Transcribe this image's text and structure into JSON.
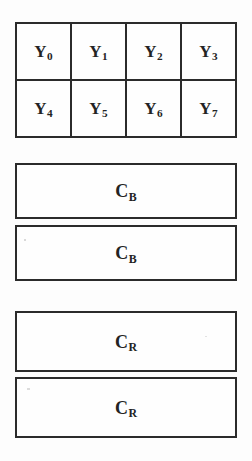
{
  "diagram": {
    "background_color": "#fdfdfd",
    "line_color": "#2b2b2b",
    "text_color": "#232323"
  },
  "luma_grid": {
    "name": "Y",
    "rows": 2,
    "cols": 4,
    "cells": [
      {
        "base": "Y",
        "sub": "0"
      },
      {
        "base": "Y",
        "sub": "1"
      },
      {
        "base": "Y",
        "sub": "2"
      },
      {
        "base": "Y",
        "sub": "3"
      },
      {
        "base": "Y",
        "sub": "4"
      },
      {
        "base": "Y",
        "sub": "5"
      },
      {
        "base": "Y",
        "sub": "6"
      },
      {
        "base": "Y",
        "sub": "7"
      }
    ]
  },
  "chroma_blocks": [
    {
      "base": "C",
      "sub": "B"
    },
    {
      "base": "C",
      "sub": "B"
    },
    {
      "base": "C",
      "sub": "R"
    },
    {
      "base": "C",
      "sub": "R"
    }
  ]
}
